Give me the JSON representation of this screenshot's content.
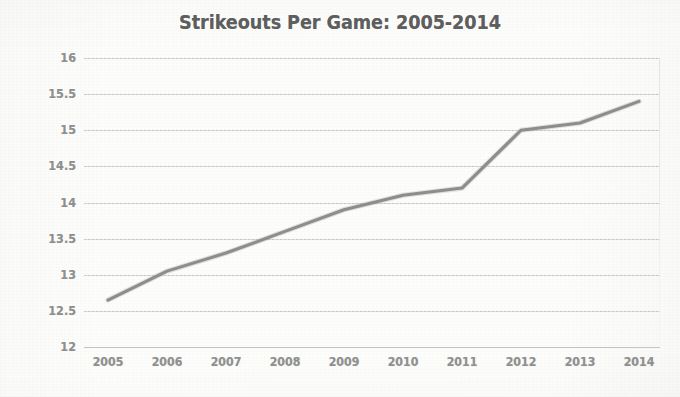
{
  "chart_data": {
    "type": "line",
    "title": "Strikeouts Per Game: 2005-2014",
    "xlabel": "",
    "ylabel": "",
    "categories": [
      "2005",
      "2006",
      "2007",
      "2008",
      "2009",
      "2010",
      "2011",
      "2012",
      "2013",
      "2014"
    ],
    "values": [
      12.65,
      13.05,
      13.3,
      13.6,
      13.9,
      14.1,
      14.2,
      15.0,
      15.1,
      15.4
    ],
    "series": [
      {
        "name": "Strikeouts Per Game",
        "values": [
          12.65,
          13.05,
          13.3,
          13.6,
          13.9,
          14.1,
          14.2,
          15.0,
          15.1,
          15.4
        ]
      }
    ],
    "ylim": [
      12,
      16
    ],
    "ytick_labels": [
      "16",
      "15.5",
      "15",
      "14.5",
      "14",
      "13.5",
      "13",
      "12.5",
      "12"
    ],
    "ytick_values": [
      16,
      15.5,
      15,
      14.5,
      14,
      13.5,
      13,
      12.5,
      12
    ],
    "xtick_labels": [
      "2005",
      "2006",
      "2007",
      "2008",
      "2009",
      "2010",
      "2011",
      "2012",
      "2013",
      "2014"
    ],
    "grid": true,
    "grid_axis": "y",
    "legend": false,
    "legend_position": "none",
    "colors": {
      "line": "#8d8d8d",
      "grid": "#dcdcdc",
      "title_text": "#5e5e5e",
      "tick_text": "#909090",
      "background": "#fdfdfc"
    }
  }
}
